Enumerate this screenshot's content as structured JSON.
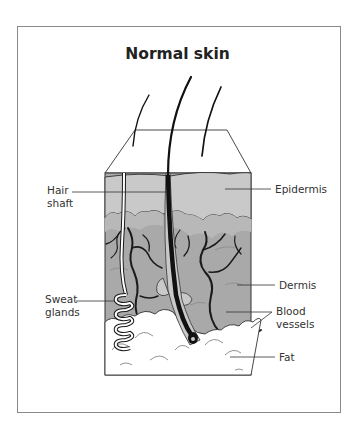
{
  "diagram": {
    "title": "Normal skin",
    "labels": {
      "hair_shaft": [
        "Hair",
        "shaft"
      ],
      "epidermis": "Epidermis",
      "dermis": "Dermis",
      "blood_vessels": [
        "Blood",
        "vessels"
      ],
      "sweat_glands": [
        "Sweat",
        "glands"
      ],
      "fat": "Fat"
    },
    "colors": {
      "epidermis": "#c9c9c9",
      "dermis": "#a9a9a9",
      "fat": "#ffffff",
      "outline": "#1a1a1a",
      "frame": "#8a8a8a"
    }
  }
}
